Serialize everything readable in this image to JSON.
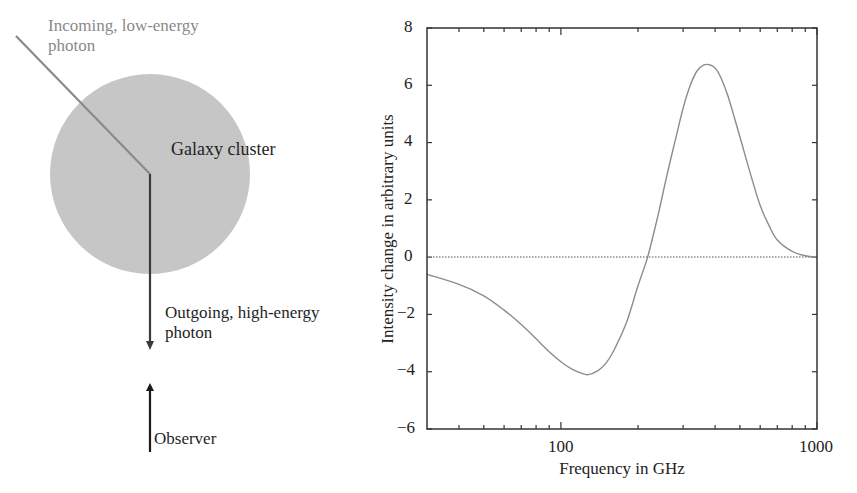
{
  "figure": {
    "diagram": {
      "incoming_label": "Incoming, low-energy\nphoton",
      "cluster_label": "Galaxy cluster",
      "outgoing_label": "Outgoing, high-energy\nphoton",
      "observer_label": "Observer",
      "colors": {
        "cluster_fill": "#c6c6c6",
        "incoming_photon": "#8a8a8a",
        "outgoing_photon": "#3a3a3a",
        "observer_arrow": "#1a1a1a"
      }
    },
    "plot": {
      "ylabel": "Intensity change in arbitrary units",
      "xlabel": "Frequency in GHz",
      "y_ticks": [
        "8",
        "6",
        "4",
        "2",
        "0",
        "−2",
        "−4",
        "−6"
      ],
      "x_ticks": [
        "100",
        "1000"
      ],
      "line_color": "#8c8c8c",
      "zero_line_color": "#8c8c8c"
    }
  },
  "chart_data": {
    "type": "line",
    "title": "",
    "xlabel": "Frequency in GHz",
    "ylabel": "Intensity change in arbitrary units",
    "xscale": "log",
    "xlim": [
      30,
      1000
    ],
    "ylim": [
      -6,
      8
    ],
    "x_tick_labels": [
      "100",
      "1000"
    ],
    "y_tick_labels": [
      "-6",
      "-4",
      "-2",
      "0",
      "2",
      "4",
      "6",
      "8"
    ],
    "grid": false,
    "legend": null,
    "reference_lines": [
      {
        "type": "horizontal",
        "y": 0,
        "style": "dotted"
      }
    ],
    "series": [
      {
        "name": "Sunyaev-Zel'dovich intensity change",
        "x": [
          30,
          40,
          50,
          60,
          70,
          80,
          90,
          100,
          110,
          120,
          128,
          140,
          150,
          160,
          180,
          200,
          218,
          240,
          260,
          280,
          300,
          320,
          340,
          360,
          380,
          400,
          420,
          450,
          500,
          550,
          600,
          650,
          700,
          800,
          900,
          1000
        ],
        "values": [
          -0.6,
          -0.95,
          -1.35,
          -1.85,
          -2.35,
          -2.85,
          -3.3,
          -3.65,
          -3.9,
          -4.05,
          -4.1,
          -3.95,
          -3.7,
          -3.3,
          -2.3,
          -1.0,
          0.0,
          1.5,
          2.9,
          4.1,
          5.2,
          6.0,
          6.5,
          6.7,
          6.72,
          6.6,
          6.3,
          5.6,
          4.2,
          2.9,
          1.8,
          1.1,
          0.6,
          0.2,
          0.05,
          0.0
        ]
      }
    ],
    "annotations": {
      "minimum": {
        "x": 128,
        "y": -4.1
      },
      "zero_crossing": {
        "x": 218,
        "y": 0
      },
      "maximum": {
        "x": 380,
        "y": 6.7
      }
    }
  }
}
